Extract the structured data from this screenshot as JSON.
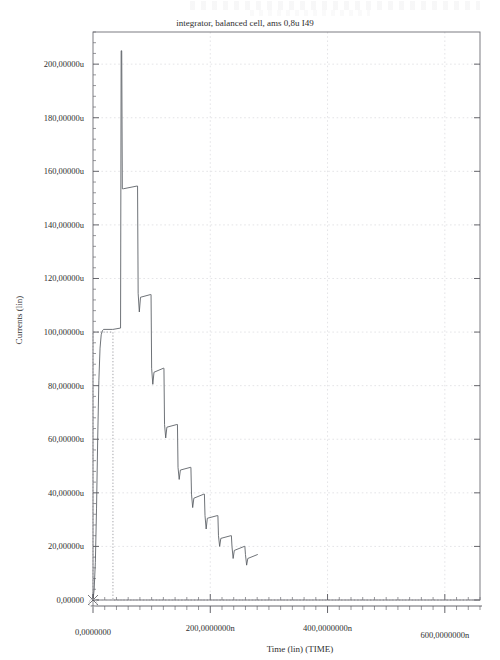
{
  "chart_data": {
    "type": "line",
    "title": "integrator, balanced cell,  ams 0,8u I49",
    "xlabel": "Time (lin) (TIME)",
    "ylabel": "Currents (lin)",
    "grid": true,
    "legend": "none",
    "xlim": [
      0,
      660
    ],
    "ylim": [
      0,
      212
    ],
    "x_unit": "n",
    "y_unit": "u",
    "x_tick_labels": [
      "0,0000000",
      "200,0000000n",
      "400,0000000n",
      "600,0000000n"
    ],
    "x_tick_values": [
      0,
      200,
      400,
      600
    ],
    "x_minor_step": 20,
    "y_tick_labels": [
      "0,00000",
      "20,00000u",
      "40,00000u",
      "60,00000u",
      "80,00000u",
      "100,00000u",
      "120,00000u",
      "140,00000u",
      "160,00000u",
      "180,00000u",
      "200,00000u"
    ],
    "y_tick_values": [
      0,
      20,
      40,
      60,
      80,
      100,
      120,
      140,
      160,
      180,
      200
    ],
    "y_minor_step": 4,
    "series": [
      {
        "name": "integrator current",
        "style": "solid",
        "color": "#555a60",
        "description": "Rising edge to 100u plateau, then decaying sawtooth staircase with sharp spikes",
        "points": [
          [
            0,
            0
          ],
          [
            2,
            4
          ],
          [
            4,
            14
          ],
          [
            6,
            34
          ],
          [
            8,
            60
          ],
          [
            10,
            82
          ],
          [
            12,
            94
          ],
          [
            14,
            99
          ],
          [
            16,
            100.5
          ],
          [
            18,
            101
          ],
          [
            33,
            101
          ],
          [
            34,
            101
          ],
          [
            47,
            101.5
          ],
          [
            48,
            205
          ],
          [
            49,
            205
          ],
          [
            50,
            153.5
          ],
          [
            52,
            153.5
          ],
          [
            75,
            154.5
          ],
          [
            76,
            154.5
          ],
          [
            77,
            114.5
          ],
          [
            79,
            107.5
          ],
          [
            81,
            113
          ],
          [
            98,
            114
          ],
          [
            99,
            114
          ],
          [
            100,
            86.5
          ],
          [
            102,
            80.5
          ],
          [
            104,
            85,
            0
          ],
          [
            120,
            86.5
          ],
          [
            121,
            86.5
          ],
          [
            122,
            65.5
          ],
          [
            124,
            60.5
          ],
          [
            126,
            64.5
          ],
          [
            143,
            65.5
          ],
          [
            144,
            65.5
          ],
          [
            145,
            49.5
          ],
          [
            147,
            45
          ],
          [
            149,
            48.5
          ],
          [
            166,
            49.5
          ],
          [
            167,
            49.5
          ],
          [
            168,
            39.5
          ],
          [
            170,
            34.5
          ],
          [
            172,
            38
          ],
          [
            189,
            39.5
          ],
          [
            190,
            39.5
          ],
          [
            191,
            31.5
          ],
          [
            193,
            26.5
          ],
          [
            195,
            30.5
          ],
          [
            212,
            31.5
          ],
          [
            213,
            31.5
          ],
          [
            214,
            24
          ],
          [
            216,
            20
          ],
          [
            218,
            23
          ],
          [
            235,
            24
          ],
          [
            236,
            24
          ],
          [
            237,
            20
          ],
          [
            239,
            15.5
          ],
          [
            241,
            18.5
          ],
          [
            258,
            20
          ],
          [
            259,
            20
          ],
          [
            260,
            17
          ],
          [
            262,
            13
          ],
          [
            264,
            15.5
          ],
          [
            281,
            17
          ]
        ]
      },
      {
        "name": "reference step",
        "style": "dotted",
        "color": "#8d8d93",
        "description": "Dotted box reference from origin up to 100u and across baseline",
        "points": [
          [
            0,
            0
          ],
          [
            0,
            100
          ],
          [
            34,
            100
          ],
          [
            34,
            0
          ],
          [
            660,
            0
          ]
        ]
      }
    ],
    "markers": [
      {
        "name": "origin-marker",
        "glyph": "x",
        "x": 0,
        "y": 0
      }
    ]
  }
}
